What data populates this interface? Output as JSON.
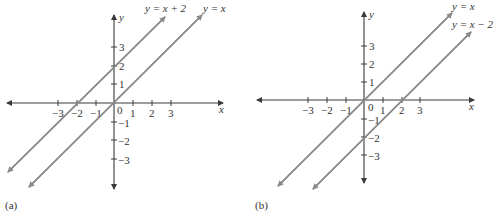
{
  "figure": {
    "panels": [
      {
        "id": "a",
        "caption": "(a)",
        "x_axis_label": "x",
        "y_axis_label": "y",
        "origin_label": "0",
        "x_ticks": [
          "−3",
          "−2",
          "−1",
          "1",
          "2",
          "3"
        ],
        "y_ticks_pos": [
          "1",
          "2",
          "3"
        ],
        "y_ticks_neg": [
          "−1",
          "−2",
          "−3"
        ],
        "lines": [
          {
            "equation": "y = x + 2",
            "slope": 1,
            "intercept": 2
          },
          {
            "equation": "y = x",
            "slope": 1,
            "intercept": 0
          }
        ]
      },
      {
        "id": "b",
        "caption": "(b)",
        "x_axis_label": "x",
        "y_axis_label": "y",
        "origin_label": "0",
        "x_ticks": [
          "−3",
          "−2",
          "−1",
          "1",
          "2",
          "3"
        ],
        "y_ticks_pos": [
          "1",
          "2",
          "3"
        ],
        "y_ticks_neg": [
          "−1",
          "−2",
          "−3"
        ],
        "lines": [
          {
            "equation": "y = x",
            "slope": 1,
            "intercept": 0
          },
          {
            "equation": "y = x − 2",
            "slope": 1,
            "intercept": -2
          }
        ]
      }
    ],
    "colors": {
      "axis": "#3a3a3a",
      "line": "#8a8a8a",
      "text": "#333333"
    }
  }
}
